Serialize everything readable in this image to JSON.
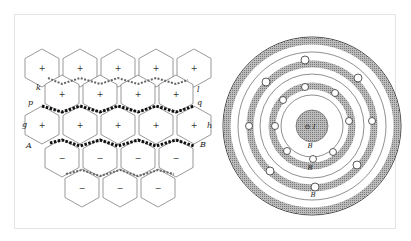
{
  "figure": {
    "left_panel": {
      "name": "hexagonal vortex cell array",
      "labels": {
        "k": "k",
        "l": "l",
        "p": "p",
        "q": "q",
        "g": "g",
        "h": "h",
        "A": "A",
        "B": "B"
      },
      "cell_signs": {
        "top_rows": "+",
        "bottom_rows": "−"
      }
    },
    "right_panel": {
      "name": "concentric vortex rings around current",
      "center_label": "⊙ I",
      "ring_labels": [
        "B",
        "B",
        "B"
      ]
    },
    "colors": {
      "line": "#333333",
      "shade": "#9a9a9a",
      "background": "#ffffff"
    }
  }
}
